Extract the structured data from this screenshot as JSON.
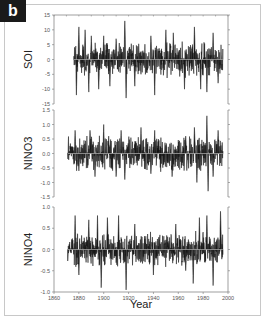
{
  "panel_label": "b",
  "chart_data": [
    {
      "type": "line",
      "title": "",
      "ylabel": "SOI",
      "xlabel": "",
      "xlim": [
        1860,
        2000
      ],
      "ylim": [
        -15,
        15
      ],
      "yticks": [
        15,
        10,
        5,
        0,
        -5,
        -10,
        -15
      ],
      "x_start": 1876,
      "x_end": 1996,
      "grid": false,
      "description": "Monthly SOI index, oscillating about zero with amplitude mostly 5-10, peaks to ~13 near 1917, lows near -13 around 1918",
      "peaks": [
        {
          "x": 1878,
          "v": -12
        },
        {
          "x": 1880,
          "v": 11
        },
        {
          "x": 1885,
          "v": 10
        },
        {
          "x": 1888,
          "v": -11
        },
        {
          "x": 1890,
          "v": 8
        },
        {
          "x": 1896,
          "v": -10
        },
        {
          "x": 1900,
          "v": 8
        },
        {
          "x": 1905,
          "v": -9
        },
        {
          "x": 1910,
          "v": 7
        },
        {
          "x": 1917,
          "v": 13
        },
        {
          "x": 1918,
          "v": -13
        },
        {
          "x": 1925,
          "v": -9
        },
        {
          "x": 1938,
          "v": 8
        },
        {
          "x": 1941,
          "v": -12
        },
        {
          "x": 1950,
          "v": 10
        },
        {
          "x": 1956,
          "v": 9
        },
        {
          "x": 1965,
          "v": -10
        },
        {
          "x": 1973,
          "v": 11
        },
        {
          "x": 1978,
          "v": -10
        },
        {
          "x": 1983,
          "v": -11
        },
        {
          "x": 1988,
          "v": 9
        },
        {
          "x": 1992,
          "v": -8
        }
      ]
    },
    {
      "type": "line",
      "title": "",
      "ylabel": "NINO3",
      "xlabel": "",
      "xlim": [
        1860,
        2000
      ],
      "ylim": [
        -1.5,
        1.5
      ],
      "yticks": [
        1.5,
        1.0,
        0.5,
        0.0,
        -0.5,
        -1.0,
        -1.5
      ],
      "x_start": 1871,
      "x_end": 1996,
      "grid": false,
      "description": "NINO3 SST index about zero, amplitude ~0.5-1.0, maximum ~1.3 near 1983, minimum ~-1.3 near 1983",
      "peaks": [
        {
          "x": 1877,
          "v": 0.8
        },
        {
          "x": 1880,
          "v": -0.6
        },
        {
          "x": 1889,
          "v": 0.8
        },
        {
          "x": 1893,
          "v": -0.8
        },
        {
          "x": 1900,
          "v": 1.0
        },
        {
          "x": 1904,
          "v": 0.6
        },
        {
          "x": 1910,
          "v": -0.8
        },
        {
          "x": 1914,
          "v": 0.8
        },
        {
          "x": 1917,
          "v": -0.9
        },
        {
          "x": 1930,
          "v": 0.9
        },
        {
          "x": 1938,
          "v": -0.7
        },
        {
          "x": 1941,
          "v": 0.8
        },
        {
          "x": 1955,
          "v": -0.8
        },
        {
          "x": 1966,
          "v": 0.6
        },
        {
          "x": 1973,
          "v": 0.9
        },
        {
          "x": 1975,
          "v": -1.0
        },
        {
          "x": 1983,
          "v": 1.3
        },
        {
          "x": 1984,
          "v": -1.3
        },
        {
          "x": 1988,
          "v": -0.8
        },
        {
          "x": 1992,
          "v": 0.8
        }
      ]
    },
    {
      "type": "line",
      "title": "",
      "ylabel": "NINO4",
      "xlabel": "Year",
      "xlim": [
        1860,
        2000
      ],
      "ylim": [
        -1.0,
        1.0
      ],
      "yticks": [
        1.0,
        0.5,
        0.0,
        -0.5,
        -1.0
      ],
      "xticks": [
        1860,
        1880,
        1900,
        1920,
        1940,
        1960,
        1980,
        2000
      ],
      "x_start": 1871,
      "x_end": 1996,
      "grid": false,
      "description": "NINO4 SST index about zero, amplitude ~0.4-0.8, extremes near -0.95 around 1918 and -0.9 around 1898",
      "peaks": [
        {
          "x": 1877,
          "v": 0.8
        },
        {
          "x": 1880,
          "v": -0.6
        },
        {
          "x": 1888,
          "v": 0.7
        },
        {
          "x": 1895,
          "v": 0.8
        },
        {
          "x": 1898,
          "v": -0.9
        },
        {
          "x": 1903,
          "v": 0.75
        },
        {
          "x": 1912,
          "v": 0.8
        },
        {
          "x": 1918,
          "v": -0.95
        },
        {
          "x": 1925,
          "v": 0.6
        },
        {
          "x": 1940,
          "v": -0.6
        },
        {
          "x": 1958,
          "v": 0.6
        },
        {
          "x": 1966,
          "v": -0.5
        },
        {
          "x": 1972,
          "v": -0.8
        },
        {
          "x": 1977,
          "v": 0.75
        },
        {
          "x": 1983,
          "v": 0.8
        },
        {
          "x": 1988,
          "v": -0.85
        },
        {
          "x": 1994,
          "v": 0.9
        }
      ]
    }
  ],
  "axes": {
    "x_tick_labels": [
      "1860",
      "1880",
      "1900",
      "1920",
      "1940",
      "1960",
      "1980",
      "2000"
    ],
    "x_label": "Year",
    "panels": [
      {
        "label": "SOI",
        "tick_labels": [
          "15",
          "10",
          "5",
          "0",
          "-5",
          "-10",
          "-15"
        ]
      },
      {
        "label": "NINO3",
        "tick_labels": [
          "1.5",
          "1.0",
          "0.5",
          "0.0",
          "-0.5",
          "-1.0",
          "-1.5"
        ]
      },
      {
        "label": "NINO4",
        "tick_labels": [
          "1.0",
          "0.5",
          "0.0",
          "-0.5",
          "-1.0"
        ]
      }
    ]
  }
}
